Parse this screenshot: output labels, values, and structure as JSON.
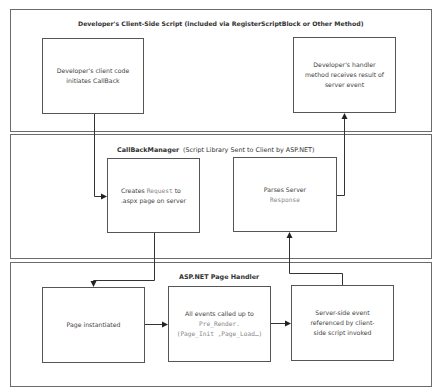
{
  "diagram": {
    "panels": {
      "client_script": {
        "title": "Developer's Client-Side Script (included via RegisterScriptBlock or Other Method)",
        "boxes": {
          "initiate": {
            "line1": "Developer's client code",
            "line2": "initiates CallBack"
          },
          "handler": {
            "line1": "Developer's handler",
            "line2": "method receives result of",
            "line3": "server event"
          }
        }
      },
      "callback_manager": {
        "title": "CallBackManager",
        "subtitle": "(Script Library Sent to Client by ASP.NET)",
        "boxes": {
          "create_request": {
            "pre": "Creates",
            "code": "Request",
            "post": "to",
            "line2": ".aspx page on server"
          },
          "parse_response": {
            "line1": "Parses Server",
            "code": "Response"
          }
        }
      },
      "page_handler": {
        "title": "ASP.NET Page Handler",
        "boxes": {
          "instantiated": {
            "line1": "Page instantiated"
          },
          "events": {
            "line1": "All events called up to",
            "code1": "Pre_Render.",
            "code2": "(Page_Init ,Page_Load…)"
          },
          "server_event": {
            "line1": "Server-side event",
            "line2": "referenced by client-",
            "line3": "side script invoked"
          }
        }
      }
    },
    "connections": [
      {
        "from": "initiate",
        "to": "create_request"
      },
      {
        "from": "create_request",
        "to": "instantiated"
      },
      {
        "from": "instantiated",
        "to": "events"
      },
      {
        "from": "events",
        "to": "server_event"
      },
      {
        "from": "server_event",
        "to": "parse_response"
      },
      {
        "from": "parse_response",
        "to": "handler"
      }
    ]
  }
}
